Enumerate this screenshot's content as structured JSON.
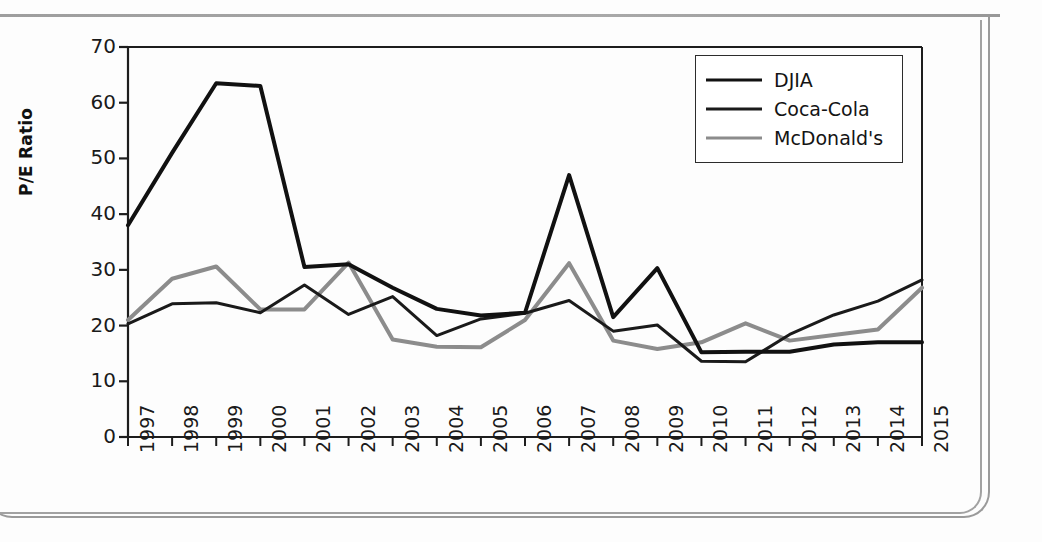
{
  "chart_data": {
    "type": "line",
    "title": "",
    "xlabel": "",
    "ylabel": "P/E Ratio",
    "ylim": [
      0,
      70
    ],
    "ytick_step": 10,
    "yticks": [
      70,
      60,
      50,
      40,
      30,
      20,
      10,
      0
    ],
    "grid": false,
    "legend_position": "top-right",
    "categories": [
      "1997",
      "1998",
      "1999",
      "2000",
      "2001",
      "2002",
      "2003",
      "2004",
      "2005",
      "2006",
      "2007",
      "2008",
      "2009",
      "2010",
      "2011",
      "2012",
      "2013",
      "2014",
      "2015"
    ],
    "series": [
      {
        "name": "DJIA",
        "color": "#111111",
        "width": 4,
        "values": [
          38.0,
          51.0,
          63.5,
          63.0,
          30.5,
          31.0,
          26.8,
          23.0,
          21.8,
          22.3,
          47.0,
          21.5,
          30.3,
          15.2,
          15.3,
          15.3,
          16.6,
          17.0,
          17.0
        ]
      },
      {
        "name": "Coca-Cola",
        "color": "#1a1a1a",
        "width": 3,
        "values": [
          20.3,
          23.9,
          24.1,
          22.3,
          27.3,
          22.0,
          25.2,
          18.2,
          21.2,
          22.2,
          24.5,
          19.0,
          20.1,
          13.6,
          13.5,
          18.4,
          21.9,
          24.4,
          28.2
        ]
      },
      {
        "name": "McDonald's",
        "color": "#8c8c8c",
        "width": 4,
        "values": [
          21.0,
          28.4,
          30.6,
          22.9,
          22.9,
          31.3,
          17.5,
          16.2,
          16.1,
          21.0,
          31.2,
          17.3,
          15.8,
          17.0,
          20.4,
          17.3,
          18.3,
          19.3,
          26.8
        ]
      }
    ]
  },
  "legend": {
    "items": [
      {
        "label": "DJIA"
      },
      {
        "label": "Coca-Cola"
      },
      {
        "label": "McDonald's"
      }
    ]
  },
  "axis": {
    "y_title": "P/E Ratio"
  }
}
